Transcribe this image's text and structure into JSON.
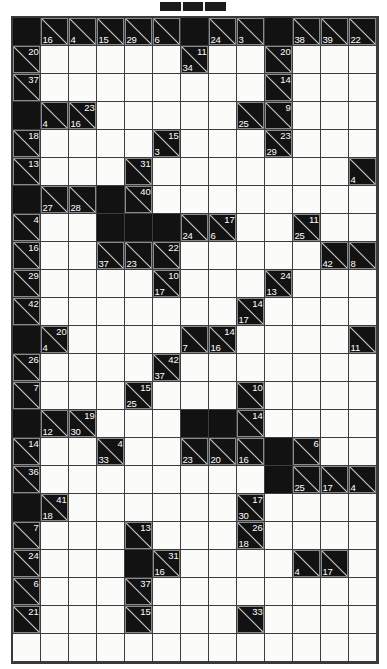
{
  "puzzle": {
    "type": "kakuro",
    "title_marker": "header-bar",
    "columns": 13,
    "rows": 23,
    "cell_size": 28,
    "colors": {
      "block": "#121212",
      "open": "#fbfbf9",
      "grid_line": "#3d3d3d",
      "border": "#3a3a3a",
      "clue_text": "#ffffff"
    },
    "legend": {
      "open_cell": "empty answer cell",
      "block_cell": "solid blocked cell",
      "clue_cell": "diagonal split cell; upper-right number = across sum, lower-left number = down sum"
    },
    "cells": [
      [
        {
          "t": "block"
        },
        {
          "t": "clue",
          "down": 16
        },
        {
          "t": "clue",
          "down": 4
        },
        {
          "t": "clue",
          "down": 15
        },
        {
          "t": "clue",
          "down": 29
        },
        {
          "t": "clue",
          "down": 6
        },
        {
          "t": "block"
        },
        {
          "t": "clue",
          "down": 24
        },
        {
          "t": "clue",
          "down": 3
        },
        {
          "t": "block"
        },
        {
          "t": "clue",
          "down": 38
        },
        {
          "t": "clue",
          "down": 39
        },
        {
          "t": "clue",
          "down": 22
        }
      ],
      [
        {
          "t": "clue",
          "across": 20
        },
        {
          "t": "open"
        },
        {
          "t": "open"
        },
        {
          "t": "open"
        },
        {
          "t": "open"
        },
        {
          "t": "open"
        },
        {
          "t": "clue",
          "across": 11,
          "down": 34
        },
        {
          "t": "open"
        },
        {
          "t": "open"
        },
        {
          "t": "clue",
          "across": 20
        },
        {
          "t": "open"
        },
        {
          "t": "open"
        },
        {
          "t": "open"
        }
      ],
      [
        {
          "t": "clue",
          "across": 37
        },
        {
          "t": "open"
        },
        {
          "t": "open"
        },
        {
          "t": "open"
        },
        {
          "t": "open"
        },
        {
          "t": "open"
        },
        {
          "t": "open"
        },
        {
          "t": "open"
        },
        {
          "t": "open"
        },
        {
          "t": "clue",
          "across": 14
        },
        {
          "t": "open"
        },
        {
          "t": "open"
        },
        {
          "t": "open"
        }
      ],
      [
        {
          "t": "block"
        },
        {
          "t": "clue",
          "down": 4
        },
        {
          "t": "clue",
          "across": 23,
          "down": 16
        },
        {
          "t": "open"
        },
        {
          "t": "open"
        },
        {
          "t": "open"
        },
        {
          "t": "open"
        },
        {
          "t": "open"
        },
        {
          "t": "clue",
          "down": 25
        },
        {
          "t": "clue",
          "across": 9
        },
        {
          "t": "open"
        },
        {
          "t": "open"
        },
        {
          "t": "open"
        }
      ],
      [
        {
          "t": "clue",
          "across": 18
        },
        {
          "t": "open"
        },
        {
          "t": "open"
        },
        {
          "t": "open"
        },
        {
          "t": "open"
        },
        {
          "t": "clue",
          "across": 15,
          "down": 3
        },
        {
          "t": "open"
        },
        {
          "t": "open"
        },
        {
          "t": "open"
        },
        {
          "t": "clue",
          "across": 23,
          "down": 29
        },
        {
          "t": "open"
        },
        {
          "t": "open"
        },
        {
          "t": "open"
        }
      ],
      [
        {
          "t": "clue",
          "across": 13
        },
        {
          "t": "open"
        },
        {
          "t": "open"
        },
        {
          "t": "open"
        },
        {
          "t": "clue",
          "across": 31
        },
        {
          "t": "open"
        },
        {
          "t": "open"
        },
        {
          "t": "open"
        },
        {
          "t": "open"
        },
        {
          "t": "open"
        },
        {
          "t": "open"
        },
        {
          "t": "open"
        },
        {
          "t": "clue",
          "down": 4
        }
      ],
      [
        {
          "t": "block"
        },
        {
          "t": "clue",
          "down": 27
        },
        {
          "t": "clue",
          "down": 28
        },
        {
          "t": "block"
        },
        {
          "t": "clue",
          "across": 40
        },
        {
          "t": "open"
        },
        {
          "t": "open"
        },
        {
          "t": "open"
        },
        {
          "t": "open"
        },
        {
          "t": "open"
        },
        {
          "t": "open"
        },
        {
          "t": "open"
        },
        {
          "t": "open"
        }
      ],
      [
        {
          "t": "clue",
          "across": 4
        },
        {
          "t": "open"
        },
        {
          "t": "open"
        },
        {
          "t": "block"
        },
        {
          "t": "block"
        },
        {
          "t": "block"
        },
        {
          "t": "clue",
          "down": 24
        },
        {
          "t": "clue",
          "across": 17,
          "down": 6
        },
        {
          "t": "open"
        },
        {
          "t": "open"
        },
        {
          "t": "clue",
          "across": 11,
          "down": 25
        },
        {
          "t": "open"
        },
        {
          "t": "open"
        }
      ],
      [
        {
          "t": "clue",
          "across": 16
        },
        {
          "t": "open"
        },
        {
          "t": "open"
        },
        {
          "t": "clue",
          "down": 37
        },
        {
          "t": "clue",
          "down": 23
        },
        {
          "t": "clue",
          "across": 22
        },
        {
          "t": "open"
        },
        {
          "t": "open"
        },
        {
          "t": "open"
        },
        {
          "t": "open"
        },
        {
          "t": "open"
        },
        {
          "t": "clue",
          "down": 42
        },
        {
          "t": "clue",
          "down": 8
        }
      ],
      [
        {
          "t": "clue",
          "across": 29
        },
        {
          "t": "open"
        },
        {
          "t": "open"
        },
        {
          "t": "open"
        },
        {
          "t": "open"
        },
        {
          "t": "clue",
          "across": 10,
          "down": 17
        },
        {
          "t": "open"
        },
        {
          "t": "open"
        },
        {
          "t": "open"
        },
        {
          "t": "clue",
          "across": 24,
          "down": 13
        },
        {
          "t": "open"
        },
        {
          "t": "open"
        },
        {
          "t": "open"
        }
      ],
      [
        {
          "t": "clue",
          "across": 42
        },
        {
          "t": "open"
        },
        {
          "t": "open"
        },
        {
          "t": "open"
        },
        {
          "t": "open"
        },
        {
          "t": "open"
        },
        {
          "t": "open"
        },
        {
          "t": "open"
        },
        {
          "t": "clue",
          "across": 14,
          "down": 17
        },
        {
          "t": "open"
        },
        {
          "t": "open"
        },
        {
          "t": "open"
        },
        {
          "t": "open"
        }
      ],
      [
        {
          "t": "block"
        },
        {
          "t": "clue",
          "across": 20,
          "down": 4
        },
        {
          "t": "open"
        },
        {
          "t": "open"
        },
        {
          "t": "open"
        },
        {
          "t": "open"
        },
        {
          "t": "clue",
          "down": 7
        },
        {
          "t": "clue",
          "across": 14,
          "down": 16
        },
        {
          "t": "open"
        },
        {
          "t": "open"
        },
        {
          "t": "open"
        },
        {
          "t": "open"
        },
        {
          "t": "clue",
          "down": 11
        }
      ],
      [
        {
          "t": "clue",
          "across": 26
        },
        {
          "t": "open"
        },
        {
          "t": "open"
        },
        {
          "t": "open"
        },
        {
          "t": "open"
        },
        {
          "t": "clue",
          "across": 42,
          "down": 37
        },
        {
          "t": "open"
        },
        {
          "t": "open"
        },
        {
          "t": "open"
        },
        {
          "t": "open"
        },
        {
          "t": "open"
        },
        {
          "t": "open"
        },
        {
          "t": "open"
        }
      ],
      [
        {
          "t": "clue",
          "across": 7
        },
        {
          "t": "open"
        },
        {
          "t": "open"
        },
        {
          "t": "open"
        },
        {
          "t": "clue",
          "across": 15,
          "down": 25
        },
        {
          "t": "open"
        },
        {
          "t": "open"
        },
        {
          "t": "open"
        },
        {
          "t": "clue",
          "across": 10
        },
        {
          "t": "open"
        },
        {
          "t": "open"
        },
        {
          "t": "open"
        },
        {
          "t": "open"
        }
      ],
      [
        {
          "t": "block"
        },
        {
          "t": "clue",
          "down": 12
        },
        {
          "t": "clue",
          "across": 19,
          "down": 30
        },
        {
          "t": "open"
        },
        {
          "t": "open"
        },
        {
          "t": "open"
        },
        {
          "t": "block"
        },
        {
          "t": "block"
        },
        {
          "t": "clue",
          "across": 14
        },
        {
          "t": "open"
        },
        {
          "t": "open"
        },
        {
          "t": "open"
        },
        {
          "t": "open"
        }
      ],
      [
        {
          "t": "clue",
          "across": 14
        },
        {
          "t": "open"
        },
        {
          "t": "open"
        },
        {
          "t": "clue",
          "across": 4,
          "down": 33
        },
        {
          "t": "open"
        },
        {
          "t": "open"
        },
        {
          "t": "clue",
          "down": 23
        },
        {
          "t": "clue",
          "down": 20
        },
        {
          "t": "clue",
          "down": 16
        },
        {
          "t": "block"
        },
        {
          "t": "clue",
          "across": 6
        },
        {
          "t": "open"
        },
        {
          "t": "open"
        }
      ],
      [
        {
          "t": "clue",
          "across": 36
        },
        {
          "t": "open"
        },
        {
          "t": "open"
        },
        {
          "t": "open"
        },
        {
          "t": "open"
        },
        {
          "t": "open"
        },
        {
          "t": "open"
        },
        {
          "t": "open"
        },
        {
          "t": "open"
        },
        {
          "t": "block"
        },
        {
          "t": "clue",
          "down": 25
        },
        {
          "t": "clue",
          "down": 17
        },
        {
          "t": "clue",
          "down": 4
        }
      ],
      [
        {
          "t": "block"
        },
        {
          "t": "clue",
          "across": 41,
          "down": 18
        },
        {
          "t": "open"
        },
        {
          "t": "open"
        },
        {
          "t": "open"
        },
        {
          "t": "open"
        },
        {
          "t": "open"
        },
        {
          "t": "open"
        },
        {
          "t": "clue",
          "across": 17,
          "down": 30
        },
        {
          "t": "open"
        },
        {
          "t": "open"
        },
        {
          "t": "open"
        },
        {
          "t": "open"
        }
      ],
      [
        {
          "t": "clue",
          "across": 7
        },
        {
          "t": "open"
        },
        {
          "t": "open"
        },
        {
          "t": "open"
        },
        {
          "t": "clue",
          "across": 13
        },
        {
          "t": "open"
        },
        {
          "t": "open"
        },
        {
          "t": "open"
        },
        {
          "t": "clue",
          "across": 26,
          "down": 18
        },
        {
          "t": "open"
        },
        {
          "t": "open"
        },
        {
          "t": "open"
        },
        {
          "t": "open"
        }
      ],
      [
        {
          "t": "clue",
          "across": 24
        },
        {
          "t": "open"
        },
        {
          "t": "open"
        },
        {
          "t": "open"
        },
        {
          "t": "block"
        },
        {
          "t": "clue",
          "across": 31,
          "down": 16
        },
        {
          "t": "open"
        },
        {
          "t": "open"
        },
        {
          "t": "open"
        },
        {
          "t": "open"
        },
        {
          "t": "clue",
          "down": 4
        },
        {
          "t": "clue",
          "down": 17
        },
        {
          "t": "open"
        }
      ],
      [
        {
          "t": "clue",
          "across": 6
        },
        {
          "t": "open"
        },
        {
          "t": "open"
        },
        {
          "t": "open"
        },
        {
          "t": "clue",
          "across": 37
        },
        {
          "t": "open"
        },
        {
          "t": "open"
        },
        {
          "t": "open"
        },
        {
          "t": "open"
        },
        {
          "t": "open"
        },
        {
          "t": "open"
        },
        {
          "t": "open"
        },
        {
          "t": "open"
        }
      ],
      [
        {
          "t": "clue",
          "across": 21
        },
        {
          "t": "open"
        },
        {
          "t": "open"
        },
        {
          "t": "open"
        },
        {
          "t": "clue",
          "across": 15
        },
        {
          "t": "open"
        },
        {
          "t": "open"
        },
        {
          "t": "open"
        },
        {
          "t": "clue",
          "across": 33
        },
        {
          "t": "open"
        },
        {
          "t": "open"
        },
        {
          "t": "open"
        },
        {
          "t": "open"
        }
      ],
      [
        {
          "t": "open"
        },
        {
          "t": "open"
        },
        {
          "t": "open"
        },
        {
          "t": "open"
        },
        {
          "t": "open"
        },
        {
          "t": "open"
        },
        {
          "t": "open"
        },
        {
          "t": "open"
        },
        {
          "t": "open"
        },
        {
          "t": "open"
        },
        {
          "t": "open"
        },
        {
          "t": "open"
        },
        {
          "t": "open"
        }
      ]
    ]
  }
}
